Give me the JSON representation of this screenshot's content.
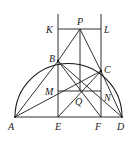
{
  "diagram": {
    "type": "geometry",
    "points": {
      "A": {
        "label": "A",
        "x": 15,
        "y": 117
      },
      "D": {
        "label": "D",
        "x": 122,
        "y": 117
      },
      "E": {
        "label": "E",
        "x": 58,
        "y": 117
      },
      "F": {
        "label": "F",
        "x": 101,
        "y": 117
      },
      "B": {
        "label": "B",
        "x": 58,
        "y": 61
      },
      "C": {
        "label": "C",
        "x": 101,
        "y": 71
      },
      "K": {
        "label": "K",
        "x": 58,
        "y": 29
      },
      "L": {
        "label": "L",
        "x": 101,
        "y": 29
      },
      "P": {
        "label": "P",
        "x": 80,
        "y": 29
      },
      "M": {
        "label": "M",
        "x": 58,
        "y": 91
      },
      "N": {
        "label": "N",
        "x": 101,
        "y": 91
      },
      "Q": {
        "label": "Q",
        "x": 80,
        "y": 91
      }
    },
    "segments": [
      "AD",
      "KL",
      "MN",
      "AB",
      "AC",
      "BD",
      "CD",
      "BF",
      "CE",
      "PB",
      "PC",
      "PQ",
      "BE",
      "CF",
      "KE-line",
      "LF-line"
    ],
    "arc": {
      "center_x": 68.5,
      "center_y": 117,
      "radius": 53.5,
      "kind": "upper semicircle"
    },
    "stroke_color": "#1a1a1a",
    "background": "#ffffff"
  }
}
